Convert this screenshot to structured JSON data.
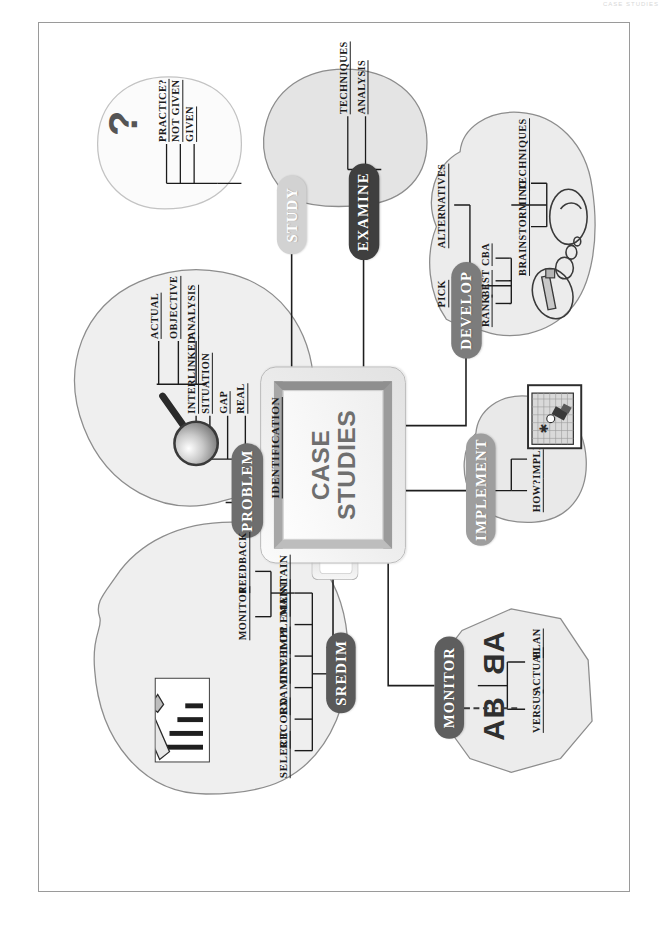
{
  "page": {
    "scan_header": "CASE STUDIES"
  },
  "center": {
    "line1": "CASE",
    "line2": "STUDIES"
  },
  "branches": [
    {
      "id": "sredim",
      "label": "SREDIM",
      "color": "#5a5a5a",
      "subs": [
        "SELECT",
        "RECORD",
        "EXAMINE",
        "DEVELOP",
        "IMPLEMENT",
        "MAINTAIN"
      ],
      "subs2": [
        "MONITOR",
        "FEEDBACK"
      ],
      "illustration": "bar-chart-with-pencil"
    },
    {
      "id": "problem",
      "label": "PROBLEM",
      "color": "#6e6e6e",
      "subs": [
        "IDENTIFICATION"
      ],
      "subs2": [
        "REAL",
        "GAP",
        "SITUATION",
        "INTERLINKED"
      ],
      "subs3": [
        "OBJECTIVE",
        "ACTUAL",
        "ANALYSIS"
      ],
      "illustration": "magnifying-glass"
    },
    {
      "id": "study",
      "label": "STUDY",
      "color": "#d2d2d2",
      "subs": [
        "GIVEN",
        "NOT GIVEN",
        "PRACTICE?"
      ],
      "illustration": "question-mark",
      "question_mark": "?"
    },
    {
      "id": "examine",
      "label": "EXAMINE",
      "color": "#3f3f3f",
      "subs": [
        "ANALYSIS",
        "TECHNIQUES"
      ]
    },
    {
      "id": "develop",
      "label": "DEVELOP",
      "color": "#7c7c7c",
      "subs": [
        "PICK",
        "ALTERNATIVES"
      ],
      "subs2": [
        "RANK",
        "BEST",
        "CBA"
      ],
      "subs3": [
        "BRAINSTORMING",
        "TECHNIQUES"
      ],
      "illustration": "thought-bubbles"
    },
    {
      "id": "implement",
      "label": "IMPLEMENT",
      "color": "#9e9e9e",
      "subs": [
        "HOW?",
        "IMPLICATIONS"
      ],
      "illustration": "tv-screen-with-plug"
    },
    {
      "id": "monitor",
      "label": "MONITOR",
      "color": "#5e5e5e",
      "subs": [
        "VERSUS"
      ],
      "subs2": [
        "ACTUAL",
        "PLAN"
      ],
      "illustration": "ab-ba-mirror",
      "mirror_text": "AB"
    }
  ]
}
